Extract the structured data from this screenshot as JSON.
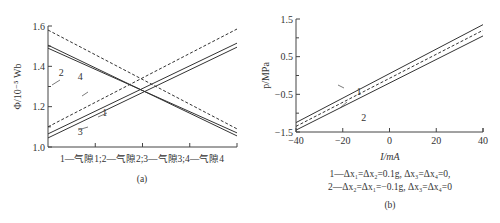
{
  "chart_data": [
    {
      "id": "a",
      "type": "line",
      "panel_label": "(a)",
      "ylabel": "Φ/10⁻⁵ Wb",
      "xlabel": "1—气隙1;2—气隙2;3—气隙3;4—气隙4",
      "ylim": [
        1.0,
        1.6
      ],
      "yticks": [
        "1.0",
        "1.2",
        "1.4",
        "1.6"
      ],
      "xlim": [
        0,
        1
      ],
      "xticks_count": 4,
      "grid": false,
      "series": [
        {
          "name": "1",
          "style": "solid",
          "x": [
            0,
            1
          ],
          "y": [
            1.065,
            1.515
          ]
        },
        {
          "name": "3",
          "style": "solid",
          "x": [
            0,
            1
          ],
          "y": [
            1.045,
            1.495
          ]
        },
        {
          "name": "2",
          "style": "solid",
          "x": [
            0,
            1
          ],
          "y": [
            1.505,
            1.055
          ]
        },
        {
          "name": "4",
          "style": "solid",
          "x": [
            0,
            1
          ],
          "y": [
            1.49,
            1.07
          ]
        },
        {
          "name": "dashed-rising",
          "style": "dashed",
          "x": [
            0,
            1
          ],
          "y": [
            1.1,
            1.585
          ]
        },
        {
          "name": "dashed-falling",
          "style": "dashed",
          "x": [
            0,
            1
          ],
          "y": [
            1.58,
            1.09
          ]
        }
      ],
      "annotations": [
        {
          "text": "1",
          "x": 0.3,
          "y": 1.175
        },
        {
          "text": "2",
          "x": 0.07,
          "y": 1.37
        },
        {
          "text": "3",
          "x": 0.17,
          "y": 1.08
        },
        {
          "text": "4",
          "x": 0.17,
          "y": 1.35
        }
      ]
    },
    {
      "id": "b",
      "type": "line",
      "panel_label": "(b)",
      "ylabel": "p/MPa",
      "xlabel": "I/mA",
      "xlim": [
        -40,
        40
      ],
      "ylim": [
        -1.5,
        1.5
      ],
      "xticks": [
        "-40",
        "-20",
        "0",
        "20",
        "40"
      ],
      "yticks": [
        "1.5",
        "0.5",
        "-0.5",
        "-1.5"
      ],
      "grid": false,
      "series": [
        {
          "name": "1",
          "style": "solid",
          "x": [
            -40,
            40
          ],
          "y": [
            -1.25,
            1.35
          ]
        },
        {
          "name": "dashed",
          "style": "dashed",
          "x": [
            -40,
            40
          ],
          "y": [
            -1.35,
            1.2
          ]
        },
        {
          "name": "2",
          "style": "solid",
          "x": [
            -40,
            40
          ],
          "y": [
            -1.45,
            1.05
          ]
        }
      ],
      "legend": [
        "1—Δx₁=Δx₂=0.1g, Δx₃=Δx₄=0,",
        "2—Δx₂=Δx₁=−0.1g, Δx₃=Δx₄=0"
      ],
      "annotations": [
        {
          "text": "1",
          "x": -13,
          "y": -0.4
        },
        {
          "text": "2",
          "x": -11,
          "y": -1.1
        }
      ]
    }
  ]
}
